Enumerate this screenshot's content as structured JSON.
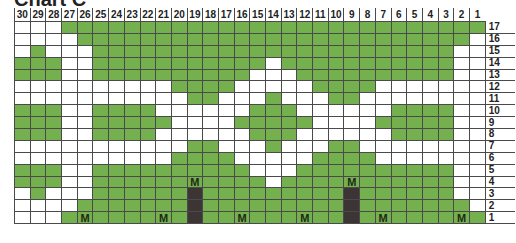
{
  "title": "Chart C",
  "chart_data": {
    "type": "table",
    "title": "Chart C",
    "columns": [
      30,
      29,
      28,
      27,
      26,
      25,
      24,
      23,
      22,
      21,
      20,
      19,
      18,
      17,
      16,
      15,
      14,
      13,
      12,
      11,
      10,
      9,
      8,
      7,
      6,
      5,
      4,
      3,
      2,
      1
    ],
    "rows_top_to_bottom": [
      17,
      16,
      15,
      14,
      13,
      12,
      11,
      10,
      9,
      8,
      7,
      6,
      5,
      4,
      3,
      2,
      1
    ],
    "legend": {
      "G": "green (contrast color)",
      "W": "white (main color)",
      "D": "dark (no stitch)",
      "M": "make-one stitch (green cell labeled M)"
    },
    "colors": {
      "G": "#74b14e",
      "W": "#ffffff",
      "D": "#3d3535",
      "M": "#74b14e"
    },
    "grid": [
      "WWWGGGGGGGGGGGGGGGGGGGGGGGGGGG",
      "WWWWGGGGGGGGGGGGGGGGGGGGGGGGGW",
      "WGWWWGGGGGGGGGGGGGGGGGGGGGGGWW",
      "GGGWWGGGGGGGGGGGWGGGGGGGGGGGWW",
      "GGGWWGGGGGGGGGGWWWGGGGGGGGGGWW",
      "WWWWWWWWWWGGGGWWWWWGGGGWWWWWWW",
      "WWWWWWWWWWWGGWWWGWWWGGWWWWWWWW",
      "GGGWWGGGGWWWWWWGGGWWWWWWGGGGWW",
      "GGGWWGGGGGWWWWGGGGGWWWWGGGGGWW",
      "GGGWWGGGGWWWWWWGGGWWWWWWGGGGWW",
      "WWWWWWWWWWWGGWWWGWWWGGWWWWWWWW",
      "WWWWWWWWWWGGGGWWWWWGGGGWWWWWWW",
      "GGGWWGGGGGGGGGGWWWGGGGGGGGGGWW",
      "GGGWWGGGGGGMGGGGWGGGGMGGGGGGWW",
      "WGWWWGGGGGGDGGGGGGGGGDGGGGGGWW",
      "WWWWGGGGGGGDGGGGGGGGGDGGGGGGGW",
      "WWWGMGGGGMGDGGMGGGMGGDGMGGGGMG"
    ]
  }
}
